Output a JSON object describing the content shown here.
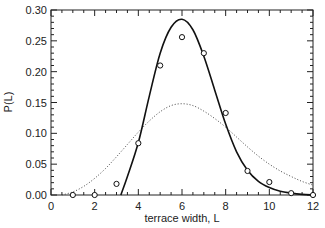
{
  "chart_data": {
    "type": "line",
    "title": "",
    "xlabel": "terrace width, L",
    "ylabel": "P(L)",
    "xlim": [
      0,
      12
    ],
    "ylim": [
      0,
      0.3
    ],
    "xticks": [
      0,
      2,
      4,
      6,
      8,
      10,
      12
    ],
    "xtick_labels": [
      "0",
      "2",
      "4",
      "6",
      "8",
      "10",
      "12"
    ],
    "yticks": [
      0.0,
      0.05,
      0.1,
      0.15,
      0.2,
      0.25,
      0.3
    ],
    "ytick_labels": [
      "0.00",
      "0.05",
      "0.10",
      "0.15",
      "0.20",
      "0.25",
      "0.30"
    ],
    "grid": false,
    "legend": null,
    "series": [
      {
        "name": "measured",
        "style": "open-circles",
        "x": [
          1,
          2,
          3,
          4,
          5,
          6,
          7,
          8,
          9,
          10,
          11,
          12
        ],
        "y": [
          0.0,
          0.0,
          0.018,
          0.084,
          0.21,
          0.256,
          0.23,
          0.133,
          0.039,
          0.021,
          0.003,
          0.0
        ]
      },
      {
        "name": "fit (solid)",
        "style": "solid-line",
        "x": [
          3.2,
          3.5,
          4.0,
          4.5,
          5.0,
          5.5,
          6.0,
          6.5,
          7.0,
          7.5,
          8.0,
          8.5,
          9.0,
          9.5,
          10.0,
          10.5,
          11.0,
          11.5,
          12.0
        ],
        "y": [
          0.0,
          0.03,
          0.085,
          0.16,
          0.23,
          0.272,
          0.285,
          0.268,
          0.225,
          0.17,
          0.115,
          0.07,
          0.04,
          0.022,
          0.012,
          0.006,
          0.003,
          0.001,
          0.0
        ]
      },
      {
        "name": "fit (dotted)",
        "style": "dotted-line",
        "x": [
          0.5,
          1,
          1.5,
          2,
          2.5,
          3,
          3.5,
          4,
          4.5,
          5,
          5.5,
          6,
          6.5,
          7,
          7.5,
          8,
          8.5,
          9,
          9.5,
          10,
          10.5,
          11,
          11.5,
          12
        ],
        "y": [
          0.0,
          0.005,
          0.014,
          0.027,
          0.043,
          0.062,
          0.082,
          0.102,
          0.12,
          0.135,
          0.145,
          0.148,
          0.145,
          0.136,
          0.124,
          0.11,
          0.094,
          0.078,
          0.063,
          0.05,
          0.039,
          0.03,
          0.022,
          0.016
        ]
      }
    ]
  }
}
